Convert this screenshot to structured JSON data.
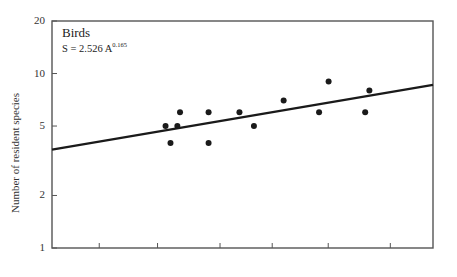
{
  "chart_data": {
    "type": "scatter",
    "title": "Birds",
    "equation": {
      "prefix": "S = 2.526 A",
      "exponent": "0.165"
    },
    "xlabel": "",
    "ylabel": "Number of resident species",
    "yscale": "log",
    "ylim": [
      1,
      20
    ],
    "yticks": [
      1,
      2,
      5,
      10,
      20
    ],
    "ytick_labels": [
      "1",
      "2",
      "5",
      "10",
      "20"
    ],
    "xscale": "log",
    "xticks_unlabeled_fraction": [
      0.124,
      0.277,
      0.441,
      0.578,
      0.725,
      0.888
    ],
    "grid": false,
    "legend": null,
    "points": [
      {
        "x_frac": 0.298,
        "y": 5
      },
      {
        "x_frac": 0.311,
        "y": 4
      },
      {
        "x_frac": 0.329,
        "y": 5
      },
      {
        "x_frac": 0.336,
        "y": 6
      },
      {
        "x_frac": 0.411,
        "y": 6
      },
      {
        "x_frac": 0.411,
        "y": 4
      },
      {
        "x_frac": 0.492,
        "y": 6
      },
      {
        "x_frac": 0.53,
        "y": 5
      },
      {
        "x_frac": 0.608,
        "y": 7
      },
      {
        "x_frac": 0.701,
        "y": 6
      },
      {
        "x_frac": 0.726,
        "y": 9
      },
      {
        "x_frac": 0.822,
        "y": 6
      },
      {
        "x_frac": 0.833,
        "y": 8
      }
    ],
    "fit_line": {
      "start": {
        "x_frac": 0.0,
        "y": 3.66
      },
      "end": {
        "x_frac": 1.0,
        "y": 8.6
      }
    }
  },
  "colors": {
    "axis": "#555555",
    "points": "#1a1a1a",
    "line": "#1a1a1a",
    "background": "#ffffff"
  }
}
